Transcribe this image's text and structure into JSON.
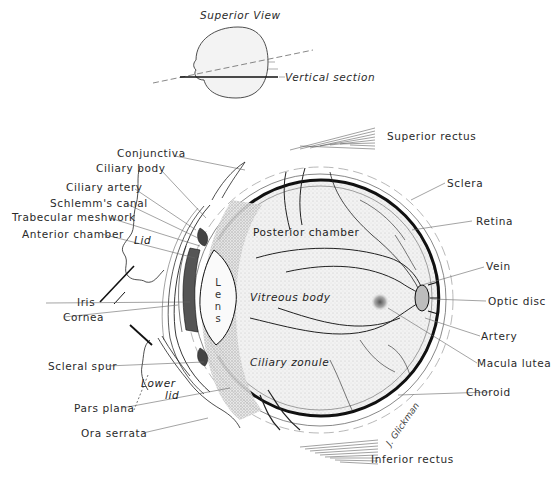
{
  "figure": {
    "inset": {
      "title": "Superior View",
      "section_label": "Vertical section"
    },
    "signature": "J. Glickman",
    "left_labels": [
      {
        "id": "conjunctiva",
        "text": "Conjunctiva"
      },
      {
        "id": "ciliary-body",
        "text": "Ciliary body"
      },
      {
        "id": "ciliary-artery",
        "text": "Ciliary artery"
      },
      {
        "id": "schlemms-canal",
        "text": "Schlemm's canal"
      },
      {
        "id": "trabecular-meshwork",
        "text": "Trabecular meshwork"
      },
      {
        "id": "anterior-chamber",
        "text": "Anterior chamber"
      },
      {
        "id": "iris",
        "text": "Iris"
      },
      {
        "id": "cornea",
        "text": "Cornea"
      },
      {
        "id": "scleral-spur",
        "text": "Scleral spur"
      },
      {
        "id": "pars-plana",
        "text": "Pars plana"
      },
      {
        "id": "ora-serrata",
        "text": "Ora serrata"
      }
    ],
    "right_labels": [
      {
        "id": "superior-rectus",
        "text": "Superior rectus"
      },
      {
        "id": "sclera",
        "text": "Sclera"
      },
      {
        "id": "retina",
        "text": "Retina"
      },
      {
        "id": "vein",
        "text": "Vein"
      },
      {
        "id": "optic-disc",
        "text": "Optic disc"
      },
      {
        "id": "artery",
        "text": "Artery"
      },
      {
        "id": "macula-lutea",
        "text": "Macula lutea"
      },
      {
        "id": "choroid",
        "text": "Choroid"
      },
      {
        "id": "inferior-rectus",
        "text": "Inferior rectus"
      }
    ],
    "inner_labels": {
      "posterior_chamber": "Posterior chamber",
      "vitreous_body": "Vitreous body",
      "ciliary_zonule": "Ciliary zonule",
      "lens_letters": [
        "L",
        "e",
        "n",
        "s"
      ],
      "lid": "Lid",
      "lower_lid_1": "Lower",
      "lower_lid_2": "lid"
    },
    "colors": {
      "ink": "#1a1a1a",
      "leader": "#555555",
      "stipple": "#e9e9e9",
      "background": "#ffffff"
    }
  }
}
